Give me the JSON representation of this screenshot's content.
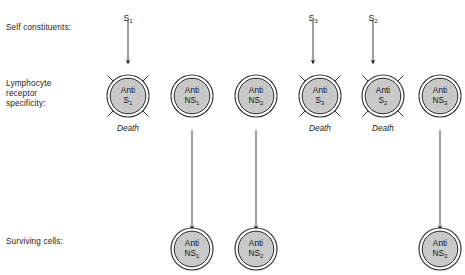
{
  "figure": {
    "width": 465,
    "height": 275,
    "background": "#ffffff",
    "ink_color": "#1a1a1a",
    "cell_fill": "#c9c9c9",
    "cell_stroke": "#2b2b2b"
  },
  "row_labels": {
    "self_constituents": "Self constituents:",
    "receptor_specificity": "Lymphocyte\nreceptor\nspecificity:",
    "surviving_cells": "Surviving  cells:"
  },
  "stimuli": [
    {
      "id": "s1",
      "base": "S",
      "sub": "1",
      "x": 128,
      "label_y": 14,
      "arrow_top": 20,
      "arrow_bottom": 62
    },
    {
      "id": "s3",
      "base": "S",
      "sub": "3",
      "x": 313,
      "label_y": 14,
      "arrow_top": 20,
      "arrow_bottom": 62
    },
    {
      "id": "s2",
      "base": "S",
      "sub": "2",
      "x": 373,
      "label_y": 14,
      "arrow_top": 20,
      "arrow_bottom": 62
    }
  ],
  "receptor_cells": [
    {
      "id": "anti-s1",
      "line1": "Anti",
      "base": "S",
      "sub": "1",
      "x": 128,
      "y": 96,
      "r": 21,
      "death": true,
      "death_label": "Death",
      "death_y": 124
    },
    {
      "id": "anti-ns1",
      "line1": "Anti",
      "base": "NS",
      "sub": "1",
      "x": 192,
      "y": 96,
      "r": 21,
      "death": false,
      "death_label": "",
      "death_y": 0
    },
    {
      "id": "anti-ns2",
      "line1": "Anti",
      "base": "NS",
      "sub": "2",
      "x": 256,
      "y": 96,
      "r": 21,
      "death": false,
      "death_label": "",
      "death_y": 0
    },
    {
      "id": "anti-s3",
      "line1": "Anti",
      "base": "S",
      "sub": "3",
      "x": 320,
      "y": 96,
      "r": 21,
      "death": true,
      "death_label": "Death",
      "death_y": 124
    },
    {
      "id": "anti-s2",
      "line1": "Anti",
      "base": "S",
      "sub": "2",
      "x": 383,
      "y": 96,
      "r": 21,
      "death": true,
      "death_label": "Death",
      "death_y": 124
    },
    {
      "id": "anti-ns3",
      "line1": "Anti",
      "base": "NS",
      "sub": "3",
      "x": 440,
      "y": 96,
      "r": 21,
      "death": false,
      "death_label": "",
      "death_y": 0
    }
  ],
  "survival_arrows": [
    {
      "id": "arrow-ns1",
      "x": 192,
      "top": 130,
      "bottom": 228
    },
    {
      "id": "arrow-ns2",
      "x": 256,
      "top": 130,
      "bottom": 228
    },
    {
      "id": "arrow-ns3",
      "x": 440,
      "top": 130,
      "bottom": 228
    }
  ],
  "surviving_cells": [
    {
      "id": "surv-ns1",
      "line1": "Anti",
      "base": "NS",
      "sub": "1",
      "x": 192,
      "y": 249,
      "r": 21
    },
    {
      "id": "surv-ns2",
      "line1": "Anti",
      "base": "NS",
      "sub": "2",
      "x": 256,
      "y": 249,
      "r": 21
    },
    {
      "id": "surv-ns3",
      "line1": "Anti",
      "base": "NS",
      "sub": "3",
      "x": 440,
      "y": 249,
      "r": 21
    }
  ]
}
